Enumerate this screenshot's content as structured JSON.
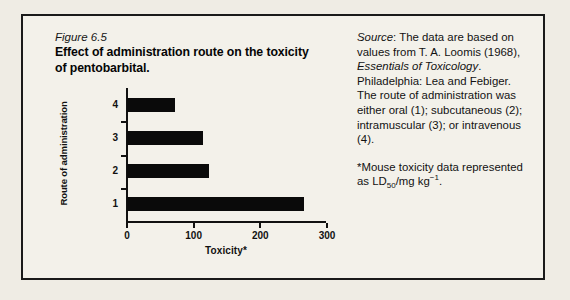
{
  "figure": {
    "number": "Figure 6.5",
    "title": "Effect of administration route on the toxicity of pentobarbital."
  },
  "source_note": {
    "label": "Source",
    "after_label": ": The data are based on values from T. A. Loomis (1968), ",
    "work_italic": "Essentials of Toxicology",
    "tail": ". Philadelphia: Lea and Febiger. The route of administration was either oral (1); subcutaneous (2); intramuscular (3); or intravenous (4)."
  },
  "footnote": {
    "lead": "*Mouse toxicity data represented as LD",
    "sub": "50",
    "mid": "/mg kg",
    "sup": "−1",
    "end": "."
  },
  "chart_data": {
    "type": "bar",
    "orientation": "horizontal",
    "title": "",
    "xlabel": "Toxicity*",
    "ylabel": "Route of administration",
    "categories": [
      "1",
      "2",
      "3",
      "4"
    ],
    "category_meanings": {
      "1": "oral",
      "2": "subcutaneous",
      "3": "intramuscular",
      "4": "intravenous"
    },
    "values": [
      265,
      123,
      114,
      72
    ],
    "xlim": [
      0,
      300
    ],
    "xticks": [
      0,
      100,
      200,
      300
    ],
    "xtick_labels": [
      "0",
      "100",
      "200",
      "300"
    ],
    "ytick_labels": [
      "4",
      "3",
      "2",
      "1"
    ],
    "grid": false,
    "legend": null,
    "bar_color": "#0a0a0a",
    "axis_color": "#111111",
    "background": "#f3f1ea"
  }
}
